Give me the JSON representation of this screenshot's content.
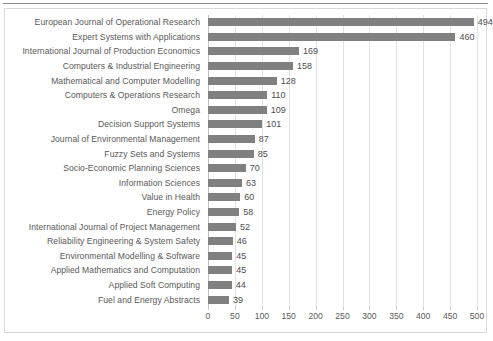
{
  "chart_data": {
    "type": "bar",
    "orientation": "horizontal",
    "title": "",
    "subtitle": "",
    "xlabel": "",
    "ylabel": "",
    "xlim": [
      0,
      500
    ],
    "xticks": [
      0,
      50,
      100,
      150,
      200,
      250,
      300,
      350,
      400,
      450,
      500
    ],
    "xtick_labels": [
      "0",
      "50",
      "100",
      "150",
      "200",
      "250",
      "300",
      "350",
      "400",
      "450",
      "500"
    ],
    "grid": "vertical",
    "legend": null,
    "data_labels": true,
    "bar_color": "#808080",
    "gridline_color": "#e2e2e2",
    "text_color": "#595959",
    "categories": [
      "European Journal of Operational Research",
      "Expert Systems with Applications",
      "International Journal of Production Economics",
      "Computers & Industrial Engineering",
      "Mathematical and Computer Modelling",
      "Computers & Operations Research",
      "Omega",
      "Decision Support Systems",
      "Journal of Environmental Management",
      "Fuzzy Sets and Systems",
      "Socio-Economic Planning Sciences",
      "Information Sciences",
      "Value in Health",
      "Energy Policy",
      "International Journal of Project Management",
      "Reliability Engineering & System Safety",
      "Environmental Modelling & Software",
      "Applied Mathematics and Computation",
      "Applied Soft Computing",
      "Fuel and Energy Abstracts"
    ],
    "values": [
      494,
      460,
      169,
      158,
      128,
      110,
      109,
      101,
      87,
      85,
      70,
      63,
      60,
      58,
      52,
      46,
      45,
      45,
      44,
      39
    ],
    "value_labels": [
      "494",
      "460",
      "169",
      "158",
      "128",
      "110",
      "109",
      "101",
      "87",
      "85",
      "70",
      "63",
      "60",
      "58",
      "52",
      "46",
      "45",
      "45",
      "44",
      "39"
    ]
  }
}
